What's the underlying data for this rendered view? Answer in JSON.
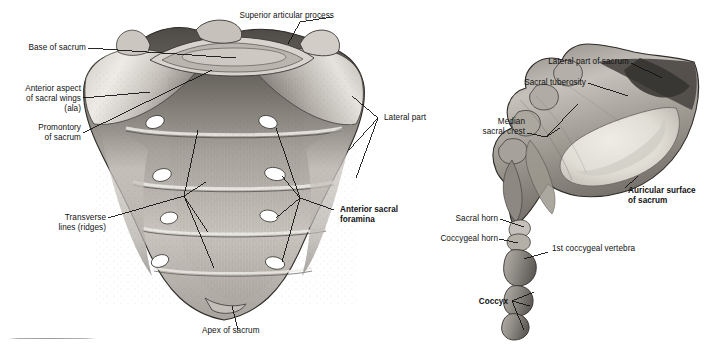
{
  "figure": {
    "background_color": "#ffffff",
    "ink_color": "#111111",
    "bone_tone_light": "#e8e5e0",
    "bone_tone_mid": "#b9b5ae",
    "bone_tone_dark": "#5e5a55",
    "foramen_color": "#ffffff"
  },
  "panels": [
    {
      "id": "anterior-view",
      "name": "Anterior (pelvic) surface of sacrum"
    },
    {
      "id": "lateral-view",
      "name": "Lateral view of sacrum and coccyx"
    }
  ],
  "labels": {
    "superior_articular_process": "Superior articular process",
    "base_of_sacrum": "Base of sacrum",
    "anterior_aspect_ala_line1": "Anterior aspect",
    "anterior_aspect_ala_line2": "of sacral wings",
    "anterior_aspect_ala_line3": "(ala)",
    "promontory_line1": "Promontory",
    "promontory_line2": "of sacrum",
    "lateral_part": "Lateral part",
    "transverse_lines_line1": "Transverse",
    "transverse_lines_line2": "lines (ridges)",
    "anterior_sacral_foramina_line1": "Anterior sacral",
    "anterior_sacral_foramina_line2": "foramina",
    "apex_of_sacrum": "Apex of sacrum",
    "lateral_part_of_sacrum": "Lateral part of sacrum",
    "sacral_tuberosity": "Sacral tuberosity",
    "median_sacral_crest_line1": "Median",
    "median_sacral_crest_line2": "sacral crest",
    "auricular_surface_line1": "Auricular surface",
    "auricular_surface_line2": "of sacrum",
    "sacral_horn": "Sacral horn",
    "coccygeal_horn": "Coccygeal horn",
    "first_coccygeal_vertebra": "1st coccygeal vertebra",
    "coccyx": "Coccyx"
  }
}
